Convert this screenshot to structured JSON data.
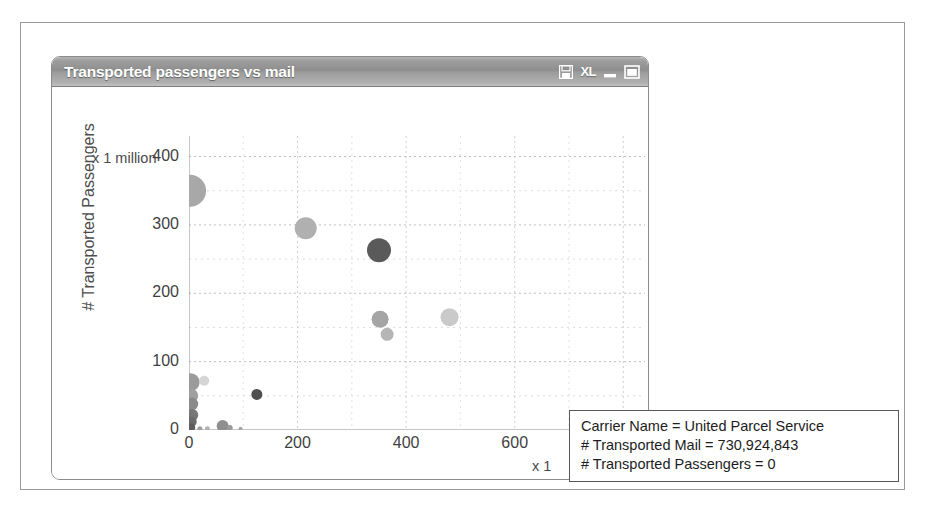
{
  "window": {
    "title": "Transported passengers vs mail",
    "buttons": [
      {
        "name": "save-icon",
        "label": ""
      },
      {
        "name": "excel-export-button",
        "label": "XL"
      },
      {
        "name": "minimize-button",
        "label": ""
      },
      {
        "name": "maximize-button",
        "label": ""
      }
    ]
  },
  "chart_data": {
    "type": "scatter",
    "title": "Transported passengers vs mail",
    "xlabel": "# Transported Mail",
    "ylabel": "# Transported Passengers",
    "x_unit": "x 1",
    "y_unit": "x 1 million",
    "xlim": [
      0,
      840
    ],
    "ylim": [
      0,
      430
    ],
    "xticks": [
      0,
      200,
      400,
      600,
      800
    ],
    "yticks": [
      0,
      100,
      200,
      300,
      400
    ],
    "grid": true,
    "grid_style": "dotted",
    "legend": "none",
    "points": [
      {
        "x": 2,
        "y": 350,
        "r": 16,
        "color": "#a8a8a8"
      },
      {
        "x": 215,
        "y": 295,
        "r": 11,
        "color": "#b0b0b0"
      },
      {
        "x": 350,
        "y": 263,
        "r": 12,
        "color": "#5a5a5a"
      },
      {
        "x": 352,
        "y": 162,
        "r": 8.5,
        "color": "#a5a5a5"
      },
      {
        "x": 480,
        "y": 165,
        "r": 9,
        "color": "#cacaca"
      },
      {
        "x": 365,
        "y": 140,
        "r": 6.5,
        "color": "#b5b5b5"
      },
      {
        "x": 3,
        "y": 70,
        "r": 9,
        "color": "#9b9b9b"
      },
      {
        "x": 28,
        "y": 72,
        "r": 5,
        "color": "#d5d5d5"
      },
      {
        "x": 4,
        "y": 50,
        "r": 7,
        "color": "#a0a0a0"
      },
      {
        "x": 5,
        "y": 38,
        "r": 6.5,
        "color": "#8a8a8a"
      },
      {
        "x": 125,
        "y": 52,
        "r": 5.5,
        "color": "#4f4f4f"
      },
      {
        "x": 6,
        "y": 22,
        "r": 6,
        "color": "#777777"
      },
      {
        "x": 5,
        "y": 12,
        "r": 5,
        "color": "#6a6a6a"
      },
      {
        "x": 4,
        "y": 4,
        "r": 4,
        "color": "#5e5e5e"
      },
      {
        "x": 20,
        "y": 2,
        "r": 2.5,
        "color": "#9e9e9e"
      },
      {
        "x": 34,
        "y": 2,
        "r": 2.5,
        "color": "#b2b2b2"
      },
      {
        "x": 62,
        "y": 6,
        "r": 6,
        "color": "#8f8f8f"
      },
      {
        "x": 75,
        "y": 3,
        "r": 3,
        "color": "#9a9a9a"
      },
      {
        "x": 95,
        "y": 2,
        "r": 2,
        "color": "#a6a6a6"
      },
      {
        "x": 731,
        "y": 6,
        "r": 5,
        "color": "#8b8b8b"
      },
      {
        "x": 716,
        "y": 3,
        "r": 2,
        "color": "#b4b4b4"
      }
    ]
  },
  "tooltip": {
    "line1": "Carrier Name = United Parcel Service",
    "line2": "# Transported Mail = 730,924,843",
    "line3": "# Transported Passengers = 0"
  }
}
